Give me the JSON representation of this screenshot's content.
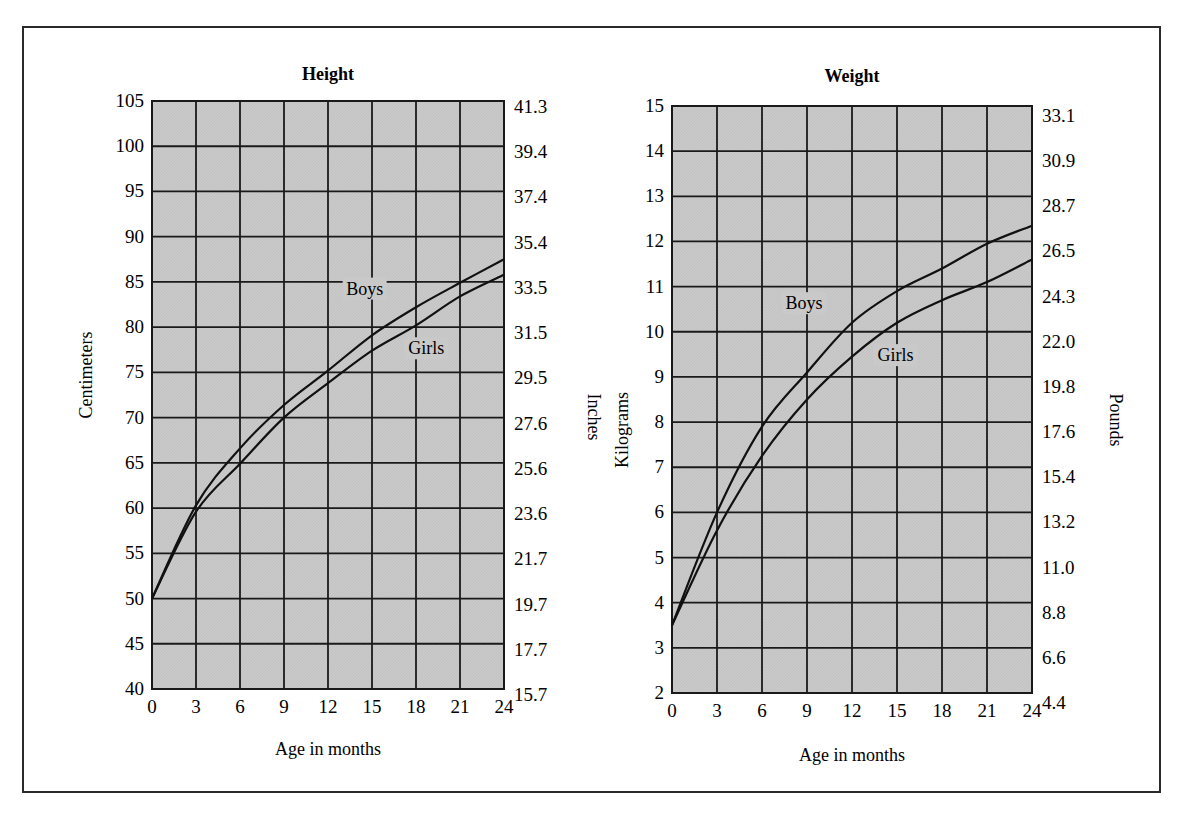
{
  "caption_clipped": "",
  "colors": {
    "plot_fill": "#c9c9c9",
    "grid": "#1a1a1a",
    "curve": "#111111",
    "frame": "#2a2a2a"
  },
  "chart_data": [
    {
      "type": "line",
      "title": "Height",
      "xlabel": "Age in months",
      "ylabel": "Centimeters",
      "ylabel_right": "Inches",
      "x": [
        0,
        3,
        6,
        9,
        12,
        15,
        18,
        21,
        24
      ],
      "x_ticks": [
        "0",
        "3",
        "6",
        "9",
        "12",
        "15",
        "18",
        "21",
        "24"
      ],
      "y_ticks": [
        "40",
        "45",
        "50",
        "55",
        "60",
        "65",
        "70",
        "75",
        "80",
        "85",
        "90",
        "95",
        "100",
        "105"
      ],
      "y_ticks_right": [
        "15.7",
        "17.7",
        "19.7",
        "21.7",
        "23.6",
        "25.6",
        "27.6",
        "29.5",
        "31.5",
        "33.5",
        "35.4",
        "37.4",
        "39.4",
        "41.3"
      ],
      "xlim": [
        0,
        24
      ],
      "ylim": [
        40,
        105
      ],
      "grid": true,
      "series": [
        {
          "name": "Boys",
          "values": [
            50.0,
            60.3,
            66.6,
            71.4,
            75.2,
            79.1,
            82.2,
            84.9,
            87.5
          ]
        },
        {
          "name": "Girls",
          "values": [
            50.0,
            59.6,
            64.9,
            70.0,
            73.8,
            77.4,
            80.2,
            83.4,
            85.8
          ]
        }
      ],
      "annotations": [
        {
          "text": "Boys",
          "x": 14.5,
          "y": 83.6
        },
        {
          "text": "Girls",
          "x": 18.7,
          "y": 77.0
        }
      ]
    },
    {
      "type": "line",
      "title": "Weight",
      "xlabel": "Age in months",
      "ylabel": "Kilograms",
      "ylabel_right": "Pounds",
      "x": [
        0,
        3,
        6,
        9,
        12,
        15,
        18,
        21,
        24
      ],
      "x_ticks": [
        "0",
        "3",
        "6",
        "9",
        "12",
        "15",
        "18",
        "21",
        "24"
      ],
      "y_ticks": [
        "2",
        "3",
        "4",
        "5",
        "6",
        "7",
        "8",
        "9",
        "10",
        "11",
        "12",
        "13",
        "14",
        "15"
      ],
      "y_ticks_right": [
        "4.4",
        "6.6",
        "8.8",
        "11.0",
        "13.2",
        "15.4",
        "17.6",
        "19.8",
        "22.0",
        "24.3",
        "26.5",
        "28.7",
        "30.9",
        "33.1"
      ],
      "xlim": [
        0,
        24
      ],
      "ylim": [
        2,
        15
      ],
      "grid": true,
      "series": [
        {
          "name": "Boys",
          "values": [
            3.5,
            6.0,
            7.9,
            9.1,
            10.2,
            10.9,
            11.4,
            11.95,
            12.35
          ]
        },
        {
          "name": "Girls",
          "values": [
            3.5,
            5.6,
            7.25,
            8.5,
            9.45,
            10.2,
            10.7,
            11.1,
            11.6
          ]
        }
      ],
      "annotations": [
        {
          "text": "Boys",
          "x": 8.8,
          "y": 10.5
        },
        {
          "text": "Girls",
          "x": 14.9,
          "y": 9.35
        }
      ]
    }
  ]
}
